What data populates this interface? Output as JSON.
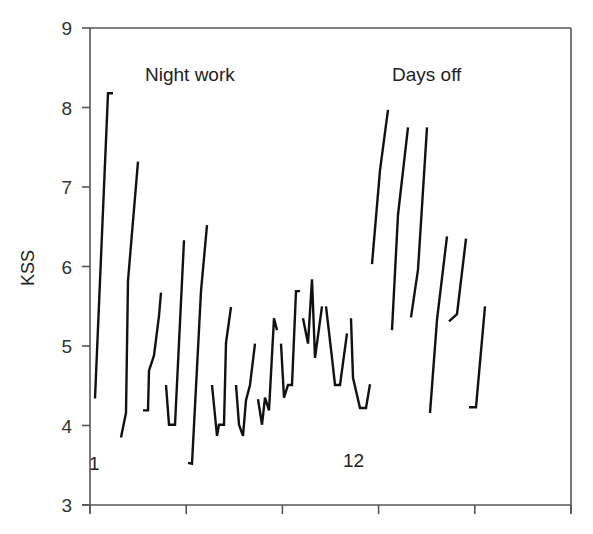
{
  "chart_data": {
    "type": "line",
    "title": "",
    "xlabel": "",
    "ylabel": "KSS",
    "ylim": [
      3,
      9
    ],
    "yticks": [
      3,
      4,
      5,
      6,
      7,
      8,
      9
    ],
    "xticks_count": 6,
    "xtick_labels": [],
    "grid": false,
    "legend": null,
    "annotations": [
      {
        "text": "Night work",
        "x_px": 145,
        "y_px": 81
      },
      {
        "text": "Days off",
        "x_px": 392,
        "y_px": 81
      },
      {
        "text": "1",
        "x_px": 90,
        "y_px": 470
      },
      {
        "text": "12",
        "x_px": 343,
        "y_px": 467
      }
    ],
    "series": [
      {
        "name": "day-1",
        "phase": "Night work",
        "x": [
          95,
          108,
          113
        ],
        "values": [
          4.34,
          8.18,
          8.18
        ]
      },
      {
        "name": "day-2",
        "phase": "Night work",
        "x": [
          121,
          126,
          128,
          138
        ],
        "values": [
          3.85,
          4.16,
          5.82,
          7.32
        ]
      },
      {
        "name": "day-3",
        "phase": "Night work",
        "x": [
          143,
          148,
          149,
          154,
          159,
          161
        ],
        "values": [
          4.19,
          4.19,
          4.69,
          4.88,
          5.38,
          5.67
        ]
      },
      {
        "name": "day-4",
        "phase": "Night work",
        "x": [
          166,
          169,
          175,
          184
        ],
        "values": [
          4.51,
          4.01,
          4.01,
          6.33
        ]
      },
      {
        "name": "day-5",
        "phase": "Night work",
        "x": [
          188,
          192,
          201,
          207
        ],
        "values": [
          3.53,
          3.52,
          5.69,
          6.52
        ]
      },
      {
        "name": "day-6",
        "phase": "Night work",
        "x": [
          212,
          217,
          219,
          224,
          226,
          231
        ],
        "values": [
          4.51,
          3.87,
          4.01,
          4.01,
          5.04,
          5.49
        ]
      },
      {
        "name": "day-7",
        "phase": "Night work",
        "x": [
          236,
          239,
          243,
          246,
          250,
          255
        ],
        "values": [
          4.51,
          4.01,
          3.87,
          4.32,
          4.51,
          5.03
        ]
      },
      {
        "name": "day-8",
        "phase": "Night work",
        "x": [
          258,
          262,
          265,
          269,
          274,
          277
        ],
        "values": [
          4.33,
          4.01,
          4.35,
          4.19,
          5.35,
          5.2
        ]
      },
      {
        "name": "day-9",
        "phase": "Night work",
        "x": [
          281,
          284,
          288,
          292,
          296,
          300
        ],
        "values": [
          5.03,
          4.35,
          4.51,
          4.51,
          5.69,
          5.69
        ]
      },
      {
        "name": "day-10",
        "phase": "Night work",
        "x": [
          303,
          308,
          312,
          315,
          322
        ],
        "values": [
          5.35,
          5.03,
          5.84,
          4.85,
          5.5
        ]
      },
      {
        "name": "day-11",
        "phase": "Night work",
        "x": [
          326,
          332,
          335,
          340,
          347
        ],
        "values": [
          5.5,
          4.85,
          4.51,
          4.51,
          5.16
        ]
      },
      {
        "name": "day-12",
        "phase": "Night work",
        "x": [
          351,
          353,
          360,
          366,
          370
        ],
        "values": [
          5.35,
          4.6,
          4.22,
          4.22,
          4.52
        ]
      },
      {
        "name": "off-1",
        "phase": "Days off",
        "x": [
          372,
          380,
          388
        ],
        "values": [
          6.03,
          7.21,
          7.97
        ]
      },
      {
        "name": "off-2",
        "phase": "Days off",
        "x": [
          392,
          398,
          408
        ],
        "values": [
          5.2,
          6.65,
          7.75
        ]
      },
      {
        "name": "off-3",
        "phase": "Days off",
        "x": [
          411,
          418,
          427
        ],
        "values": [
          5.36,
          5.96,
          7.75
        ]
      },
      {
        "name": "off-4",
        "phase": "Days off",
        "x": [
          430,
          437,
          447
        ],
        "values": [
          4.16,
          5.33,
          6.38
        ]
      },
      {
        "name": "off-5",
        "phase": "Days off",
        "x": [
          449,
          457,
          466
        ],
        "values": [
          5.31,
          5.4,
          6.35
        ]
      },
      {
        "name": "off-6",
        "phase": "Days off",
        "x": [
          469,
          476,
          485
        ],
        "values": [
          4.23,
          4.23,
          5.5
        ]
      }
    ]
  },
  "labels": {
    "ylabel": "KSS",
    "night_work": "Night work",
    "days_off": "Days off",
    "day_start": "1",
    "day_end": "12",
    "yticks": [
      "9",
      "8",
      "7",
      "6",
      "5",
      "4",
      "3"
    ]
  }
}
